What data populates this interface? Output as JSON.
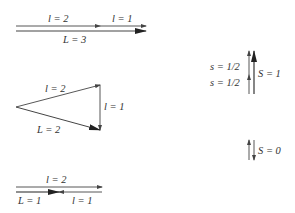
{
  "diagram": {
    "colors": {
      "line": "#444444",
      "text": "#333333",
      "background": "#ffffff"
    },
    "panels": [
      {
        "id": "parallel",
        "labels": {
          "top_left": "l = 2",
          "top_right": "l = 1",
          "bottom": "L = 3"
        }
      },
      {
        "id": "triangle",
        "labels": {
          "upper": "l = 2",
          "vertical": "l = 1",
          "lower": "L = 2"
        }
      },
      {
        "id": "antiparallel",
        "labels": {
          "top": "l = 2",
          "bottom_left": "L = 1",
          "bottom_right": "l = 1"
        }
      }
    ],
    "spin": {
      "triplet": {
        "s_upper": "s = 1/2",
        "s_lower": "s = 1/2",
        "total": "S = 1"
      },
      "singlet": {
        "total": "S = 0"
      }
    }
  }
}
